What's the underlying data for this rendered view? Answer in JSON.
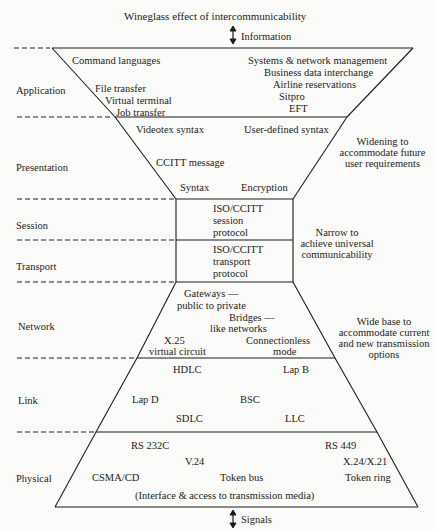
{
  "title": "Wineglass effect of intercommunicability",
  "top_arrow_label": "Information",
  "bottom_arrow_label": "Signals",
  "layers": [
    {
      "name": "Application",
      "items": [
        "Command languages",
        "File transfer",
        "Virtual terminal",
        "Job transfer",
        "Systems & network management",
        "Business data interchange",
        "Airline reservations",
        "Sitpro",
        "EFT"
      ]
    },
    {
      "name": "Presentation",
      "items": [
        "Videotex syntax",
        "User-defined syntax",
        "CCITT message",
        "Syntax",
        "Encryption"
      ]
    },
    {
      "name": "Session",
      "items": [
        "ISO/CCITT",
        "session",
        "protocol"
      ]
    },
    {
      "name": "Transport",
      "items": [
        "ISO/CCITT",
        "transport",
        "protocol"
      ]
    },
    {
      "name": "Network",
      "items": [
        "Gateways —",
        "public to private",
        "Bridges —",
        "like networks",
        "X.25",
        "virtual circuit",
        "Connectionless",
        "mode"
      ]
    },
    {
      "name": "Link",
      "items": [
        "HDLC",
        "Lap B",
        "Lap D",
        "BSC",
        "SDLC",
        "LLC"
      ]
    },
    {
      "name": "Physical",
      "items": [
        "RS 232C",
        "V.24",
        "CSMA/CD",
        "Token bus",
        "RS 449",
        "X.24/X.21",
        "Token ring",
        "(Interface & access to transmission media)"
      ]
    }
  ],
  "annotations": {
    "widening": [
      "Widening to",
      "accommodate future",
      "user requirements"
    ],
    "narrow": [
      "Narrow to",
      "achieve universal",
      "communicability"
    ],
    "wide_base": [
      "Wide base to",
      "accommodate current",
      "and new transmission",
      "options"
    ]
  }
}
